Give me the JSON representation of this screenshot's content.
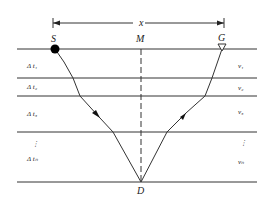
{
  "diagram": {
    "title_labels": {
      "offset": "x",
      "source": "S",
      "receiver": "G",
      "midpoint": "M",
      "depth_point": "D"
    },
    "layers": [
      {
        "time_label": "Δ t₁",
        "velocity_label": "v₁"
      },
      {
        "time_label": "Δ t₂",
        "velocity_label": "v₂"
      },
      {
        "time_label": "Δ t₃",
        "velocity_label": "v₃"
      },
      {
        "time_label": "Δ tₙ",
        "velocity_label": "vₙ",
        "ellipsis": "⋮"
      }
    ],
    "colors": {
      "line": "#333333",
      "source_marker": "#000000",
      "background": "#ffffff"
    }
  }
}
